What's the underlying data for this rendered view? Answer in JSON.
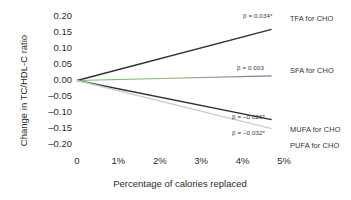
{
  "chart_data": {
    "type": "line",
    "title": "",
    "xlabel": "Percentage of calories replaced",
    "ylabel": "Change in TC/HDL-C ratio",
    "xlim": [
      0,
      5
    ],
    "ylim": [
      -0.2,
      0.2
    ],
    "grid": false,
    "legend_position": "right-inline",
    "x_tick_labels": [
      "0",
      "1%",
      "2%",
      "3%",
      "4%",
      "5%"
    ],
    "x_tick_values": [
      0,
      1,
      2,
      3,
      4,
      5
    ],
    "y_tick_labels": [
      "0.20",
      "0.15",
      "0.10",
      "0.05",
      "0.00",
      "–0.05",
      "–0.10",
      "–0.15",
      "–0.20"
    ],
    "y_tick_values": [
      0.2,
      0.15,
      0.1,
      0.05,
      0.0,
      -0.05,
      -0.1,
      -0.15,
      -0.2
    ],
    "x": [
      0,
      4.7
    ],
    "series": [
      {
        "name": "TFA for CHO",
        "label": "TFA for CHO",
        "beta": 0.034,
        "beta_text": "β = 0.034*",
        "color": "#2f2f33",
        "values": [
          0,
          0.1598
        ]
      },
      {
        "name": "SFA for CHO",
        "label": "SFA for CHO",
        "beta": 0.003,
        "beta_text": "β = 0.003",
        "color": "#8a6d9e",
        "color_start": "#4ec94e",
        "values": [
          0,
          0.0141
        ]
      },
      {
        "name": "MUFA for CHO",
        "label": "MUFA for CHO",
        "beta": -0.026,
        "beta_text": "β = –0.026*",
        "color": "#2f2f33",
        "values": [
          0,
          -0.1222
        ]
      },
      {
        "name": "PUFA for CHO",
        "label": "PUFA for CHO",
        "beta": -0.032,
        "beta_text": "β = –0.032*",
        "color": "#cdcdcd",
        "values": [
          0,
          -0.1504
        ]
      }
    ]
  },
  "axis": {
    "y_title": "Change in TC/HDL-C ratio",
    "x_title": "Percentage of calories replaced"
  },
  "annotations": {
    "tfa_beta": "β = 0.034*",
    "sfa_beta": "β = 0.003",
    "mufa_beta": "β = –0.026*",
    "pufa_beta": "β = –0.032*"
  },
  "labels": {
    "tfa": "TFA for CHO",
    "sfa": "SFA for CHO",
    "mufa": "MUFA for CHO",
    "pufa": "PUFA for CHO"
  }
}
